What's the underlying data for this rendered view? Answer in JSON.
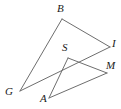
{
  "figure": {
    "type": "geometric-diagram",
    "width": 121,
    "height": 109,
    "background_color": "#ffffff",
    "stroke_color": "#6e6e6e",
    "stroke_width": 1,
    "label_color": "#1a1a1a",
    "points": {
      "B": {
        "x": 62,
        "y": 19,
        "label": "B",
        "label_x": 57,
        "label_y": 3
      },
      "I": {
        "x": 110,
        "y": 47,
        "label": "I",
        "label_x": 112,
        "label_y": 38
      },
      "S": {
        "x": 68,
        "y": 58,
        "label": "S",
        "label_x": 62,
        "label_y": 42
      },
      "M": {
        "x": 107,
        "y": 73,
        "label": "M",
        "label_x": 106,
        "label_y": 60
      },
      "G": {
        "x": 20,
        "y": 91,
        "label": "G",
        "label_x": 5,
        "label_y": 86
      },
      "A": {
        "x": 49,
        "y": 98,
        "label": "A",
        "label_x": 40,
        "label_y": 93
      }
    },
    "segments": [
      {
        "name": "segment-BG",
        "from": "B",
        "to": "G"
      },
      {
        "name": "segment-BI",
        "from": "B",
        "to": "I"
      },
      {
        "name": "segment-GI",
        "from": "G",
        "to": "I"
      },
      {
        "name": "segment-SA",
        "from": "S",
        "to": "A"
      },
      {
        "name": "segment-SM",
        "from": "S",
        "to": "M"
      },
      {
        "name": "segment-AM",
        "from": "A",
        "to": "M"
      }
    ]
  }
}
